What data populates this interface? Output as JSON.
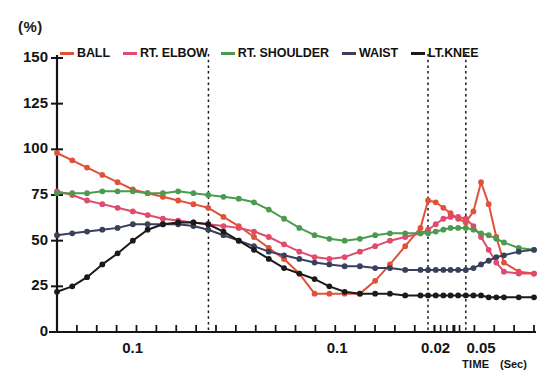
{
  "chart_data": {
    "type": "line",
    "title": "",
    "subtitle": "",
    "ylabel": "(%)",
    "xlabel": "TIME (Sec)",
    "xlabel_main": "TIME",
    "xlabel_unit": "(Sec)",
    "ylim": [
      0,
      150
    ],
    "yticks": [
      0,
      25,
      50,
      75,
      100,
      125,
      150
    ],
    "ytick_labels": [
      "0",
      "25",
      "50",
      "75",
      "100",
      "125",
      "150"
    ],
    "xtick_labels": [
      "0.1",
      "0.1",
      "0.02",
      "0.05"
    ],
    "xtick_label_positions": [
      0.1587,
      0.5873,
      0.7937,
      0.8889
    ],
    "xtick_count": 25,
    "grid": false,
    "legend_position": "top",
    "vertical_markers": [
      0.3175,
      0.7778,
      0.8571
    ],
    "legend": [
      {
        "name": "BALL",
        "color": "#e0513a"
      },
      {
        "name": "RT. ELBOW",
        "color": "#e04a6d"
      },
      {
        "name": "RT. SHOULDER",
        "color": "#4a9b4e"
      },
      {
        "name": "WAIST",
        "color": "#3a3f5c"
      },
      {
        "name": "LT.KNEE",
        "color": "#1a1a1a"
      }
    ],
    "series": [
      {
        "name": "BALL",
        "color": "#e0513a",
        "x": [
          0.0,
          0.032,
          0.063,
          0.095,
          0.127,
          0.159,
          0.19,
          0.222,
          0.254,
          0.286,
          0.317,
          0.349,
          0.381,
          0.413,
          0.444,
          0.476,
          0.508,
          0.54,
          0.571,
          0.603,
          0.635,
          0.667,
          0.698,
          0.73,
          0.762,
          0.778,
          0.794,
          0.81,
          0.825,
          0.841,
          0.857,
          0.873,
          0.889,
          0.905,
          0.921,
          0.937,
          0.968,
          1.0
        ],
        "values": [
          98,
          94,
          90,
          86,
          82,
          78,
          76,
          74,
          72,
          70,
          68,
          63,
          58,
          52,
          46,
          40,
          32,
          21,
          21,
          21,
          21,
          28,
          37,
          47,
          57,
          72,
          71,
          68,
          65,
          62,
          60,
          66,
          82,
          70,
          52,
          38,
          33,
          32
        ]
      },
      {
        "name": "RT. ELBOW",
        "color": "#e04a6d",
        "x": [
          0.0,
          0.032,
          0.063,
          0.095,
          0.127,
          0.159,
          0.19,
          0.222,
          0.254,
          0.286,
          0.317,
          0.349,
          0.381,
          0.413,
          0.444,
          0.476,
          0.508,
          0.54,
          0.571,
          0.603,
          0.635,
          0.667,
          0.698,
          0.73,
          0.762,
          0.778,
          0.794,
          0.81,
          0.825,
          0.841,
          0.857,
          0.873,
          0.889,
          0.905,
          0.921,
          0.937,
          0.968,
          1.0
        ],
        "values": [
          77,
          75,
          72,
          70,
          68,
          66,
          64,
          62,
          61,
          60,
          59,
          58,
          57,
          55,
          52,
          48,
          44,
          41,
          40,
          41,
          44,
          47,
          50,
          52,
          54,
          56,
          59,
          62,
          63,
          63,
          62,
          58,
          52,
          45,
          38,
          33,
          32,
          32
        ]
      },
      {
        "name": "RT. SHOULDER",
        "color": "#4a9b4e",
        "x": [
          0.0,
          0.032,
          0.063,
          0.095,
          0.127,
          0.159,
          0.19,
          0.222,
          0.254,
          0.286,
          0.317,
          0.349,
          0.381,
          0.413,
          0.444,
          0.476,
          0.508,
          0.54,
          0.571,
          0.603,
          0.635,
          0.667,
          0.698,
          0.73,
          0.762,
          0.778,
          0.794,
          0.81,
          0.825,
          0.841,
          0.857,
          0.873,
          0.889,
          0.905,
          0.921,
          0.937,
          0.968,
          1.0
        ],
        "values": [
          76,
          76,
          76,
          77,
          77,
          77,
          76,
          76,
          77,
          76,
          75,
          74,
          73,
          71,
          67,
          62,
          57,
          53,
          51,
          50,
          51,
          53,
          54,
          54,
          54,
          54,
          55,
          56,
          57,
          57,
          57,
          56,
          54,
          53,
          51,
          49,
          46,
          45
        ]
      },
      {
        "name": "WAIST",
        "color": "#3a3f5c",
        "x": [
          0.0,
          0.032,
          0.063,
          0.095,
          0.127,
          0.159,
          0.19,
          0.222,
          0.254,
          0.286,
          0.317,
          0.349,
          0.381,
          0.413,
          0.444,
          0.476,
          0.508,
          0.54,
          0.571,
          0.603,
          0.635,
          0.667,
          0.698,
          0.73,
          0.762,
          0.778,
          0.794,
          0.81,
          0.825,
          0.841,
          0.857,
          0.873,
          0.889,
          0.905,
          0.921,
          0.937,
          0.968,
          1.0
        ],
        "values": [
          53,
          54,
          55,
          56,
          57,
          59,
          59,
          59,
          59,
          58,
          56,
          53,
          50,
          47,
          44,
          42,
          40,
          38,
          37,
          36,
          36,
          35,
          35,
          34,
          34,
          34,
          34,
          34,
          34,
          34,
          34,
          35,
          37,
          39,
          41,
          42,
          44,
          45
        ]
      },
      {
        "name": "LT.KNEE",
        "color": "#1a1a1a",
        "x": [
          0.0,
          0.032,
          0.063,
          0.095,
          0.127,
          0.159,
          0.19,
          0.222,
          0.254,
          0.286,
          0.317,
          0.349,
          0.381,
          0.413,
          0.444,
          0.476,
          0.508,
          0.54,
          0.571,
          0.603,
          0.635,
          0.667,
          0.698,
          0.73,
          0.762,
          0.778,
          0.794,
          0.81,
          0.825,
          0.841,
          0.857,
          0.873,
          0.889,
          0.905,
          0.921,
          0.937,
          0.968,
          1.0
        ],
        "values": [
          22,
          25,
          30,
          37,
          43,
          50,
          56,
          59,
          60,
          60,
          59,
          55,
          50,
          45,
          40,
          35,
          32,
          29,
          25,
          22,
          21,
          21,
          21,
          20,
          20,
          20,
          20,
          20,
          20,
          20,
          20,
          20,
          20,
          19,
          19,
          19,
          19,
          19
        ]
      }
    ]
  },
  "axes": {
    "y_unit": "(%)",
    "x_title": "TIME",
    "x_unit": "(Sec)"
  }
}
